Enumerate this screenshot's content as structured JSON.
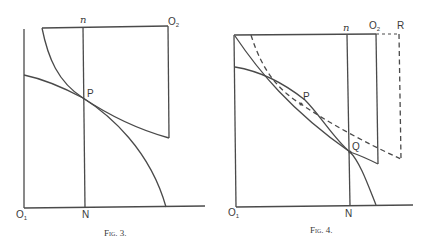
{
  "figures": [
    {
      "id": "fig3",
      "caption": "Fig. 3.",
      "labels": {
        "origin_left": "O",
        "origin_left_sub": "1",
        "origin_right": "O",
        "origin_right_sub": "2",
        "top_vertical": "n",
        "bottom_vertical": "N",
        "intersection": "P"
      },
      "elements": [
        "left axis",
        "baseline",
        "top edge from O2",
        "right edge from O2",
        "vertical line nN",
        "convex curve from top to P",
        "concave curve from left axis through P to baseline",
        "lower curve from P to right edge"
      ]
    },
    {
      "id": "fig4",
      "caption": "Fig. 4.",
      "labels": {
        "origin_left": "O",
        "origin_left_sub": "1",
        "origin_right": "O",
        "origin_right_sub": "2",
        "top_vertical": "n",
        "bottom_vertical": "N",
        "point_p": "P",
        "point_q": "Q",
        "shifted_corner": "R"
      },
      "elements": [
        "left axis",
        "baseline",
        "top edge to O2",
        "dashed extension to R",
        "right edge from O2",
        "dashed vertical from R",
        "vertical line nN",
        "solid curves intersecting at Q",
        "dashed curve through P",
        "solid curve through P"
      ]
    }
  ]
}
